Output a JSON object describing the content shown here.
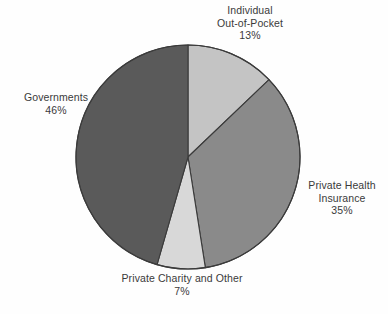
{
  "chart_data": {
    "type": "pie",
    "title": "",
    "subtitle": "",
    "xlabel": "",
    "ylabel": "",
    "legend_position": "none",
    "grid": false,
    "label_format": "name + percent",
    "start_angle_deg": 0,
    "direction": "clockwise",
    "categories": [
      "Individual Out-of-Pocket",
      "Private Health Insurance",
      "Private Charity and Other",
      "Governments"
    ],
    "values": [
      13,
      35,
      7,
      46
    ],
    "units": "percent",
    "slices": [
      {
        "name": "Individual Out-of-Pocket",
        "value": 13,
        "percent_text": "13%",
        "color": "#c4c4c4",
        "label_lines": [
          "Individual",
          "Out-of-Pocket",
          "13%"
        ],
        "label_position": "top"
      },
      {
        "name": "Private Health Insurance",
        "value": 35,
        "percent_text": "35%",
        "color": "#8a8a8a",
        "label_lines": [
          "Private Health",
          "Insurance",
          "35%"
        ],
        "label_position": "right"
      },
      {
        "name": "Private Charity and Other",
        "value": 7,
        "percent_text": "7%",
        "color": "#d8d8d8",
        "label_lines": [
          "Private Charity and Other",
          "7%"
        ],
        "label_position": "bottom"
      },
      {
        "name": "Governments",
        "value": 46,
        "percent_text": "46%",
        "color": "#5a5a5a",
        "label_lines": [
          "Governments",
          "46%"
        ],
        "label_position": "left"
      }
    ]
  },
  "labels": {
    "individual": {
      "line1": "Individual",
      "line2": "Out-of-Pocket",
      "line3": "13%"
    },
    "insurance": {
      "line1": "Private Health",
      "line2": "Insurance",
      "line3": "35%"
    },
    "charity": {
      "line1": "Private Charity and Other",
      "line2": "7%"
    },
    "governments": {
      "line1": "Governments",
      "line2": "46%"
    }
  },
  "style": {
    "background": "#fefefe",
    "text_color": "#3a3a3a",
    "slice_outline": "#3b3b3b"
  }
}
